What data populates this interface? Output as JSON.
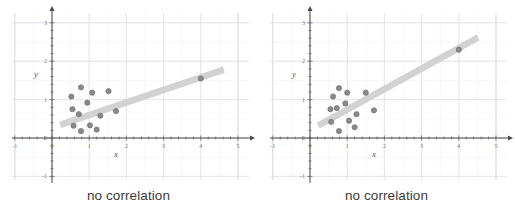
{
  "figure": {
    "background_color": "#ffffff",
    "panel_count": 2
  },
  "panels": [
    {
      "id": "left",
      "caption": "no correlation",
      "axis": {
        "x_label": "x",
        "y_label": "y",
        "x_ticks": [
          "-1",
          "0",
          "1",
          "2",
          "3",
          "4",
          "5"
        ],
        "y_ticks": [
          "3",
          "2",
          "1",
          "0",
          "-1"
        ]
      }
    },
    {
      "id": "right",
      "caption": "no correlation",
      "axis": {
        "x_label": "x",
        "y_label": "y",
        "x_ticks": [
          "-1",
          "0",
          "1",
          "2",
          "3",
          "4",
          "5"
        ],
        "y_ticks": [
          "3",
          "2",
          "1",
          "0",
          "-1"
        ]
      }
    }
  ],
  "chart_data": [
    {
      "type": "scatter",
      "title": "no correlation",
      "xlabel": "x",
      "ylabel": "y",
      "xlim": [
        -1.2,
        5.1
      ],
      "ylim": [
        -1.4,
        3.2
      ],
      "x_ticks": [
        -1,
        0,
        1,
        2,
        3,
        4,
        5
      ],
      "y_ticks": [
        -1,
        0,
        1,
        2,
        3
      ],
      "grid": true,
      "legend": null,
      "point_color": "#8a8a8a",
      "trendline_color": "#d2d2d2",
      "points": [
        {
          "x": 0.55,
          "y": 0.75
        },
        {
          "x": 0.52,
          "y": 1.08
        },
        {
          "x": 0.58,
          "y": 0.32
        },
        {
          "x": 0.72,
          "y": 0.62
        },
        {
          "x": 0.78,
          "y": 1.32
        },
        {
          "x": 0.78,
          "y": 0.18
        },
        {
          "x": 0.95,
          "y": 0.92
        },
        {
          "x": 1.02,
          "y": 0.33
        },
        {
          "x": 1.08,
          "y": 1.18
        },
        {
          "x": 1.2,
          "y": 0.22
        },
        {
          "x": 1.3,
          "y": 0.58
        },
        {
          "x": 1.52,
          "y": 1.22
        },
        {
          "x": 1.72,
          "y": 0.7
        },
        {
          "x": 4.0,
          "y": 1.55
        }
      ],
      "trendline": {
        "x0": 0.22,
        "y0": 0.34,
        "x1": 4.62,
        "y1": 1.78
      }
    },
    {
      "type": "scatter",
      "title": "no correlation",
      "xlabel": "x",
      "ylabel": "y",
      "xlim": [
        -1.2,
        5.1
      ],
      "ylim": [
        -1.4,
        3.2
      ],
      "x_ticks": [
        -1,
        0,
        1,
        2,
        3,
        4,
        5
      ],
      "y_ticks": [
        -1,
        0,
        1,
        2,
        3
      ],
      "grid": true,
      "legend": null,
      "point_color": "#8a8a8a",
      "trendline_color": "#d2d2d2",
      "points": [
        {
          "x": 0.55,
          "y": 0.75
        },
        {
          "x": 0.62,
          "y": 1.08
        },
        {
          "x": 0.57,
          "y": 0.42
        },
        {
          "x": 0.72,
          "y": 0.78
        },
        {
          "x": 0.78,
          "y": 1.3
        },
        {
          "x": 0.78,
          "y": 0.18
        },
        {
          "x": 0.95,
          "y": 0.9
        },
        {
          "x": 1.0,
          "y": 1.18
        },
        {
          "x": 1.05,
          "y": 0.45
        },
        {
          "x": 1.2,
          "y": 0.28
        },
        {
          "x": 1.25,
          "y": 0.62
        },
        {
          "x": 1.5,
          "y": 1.18
        },
        {
          "x": 1.72,
          "y": 0.72
        },
        {
          "x": 4.0,
          "y": 2.3
        }
      ],
      "trendline": {
        "x0": 0.22,
        "y0": 0.32,
        "x1": 4.52,
        "y1": 2.62
      }
    }
  ]
}
